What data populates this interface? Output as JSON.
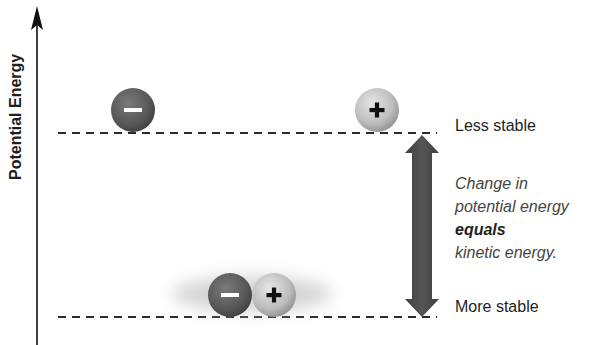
{
  "axis": {
    "label": "Potential Energy"
  },
  "levels": {
    "top": {
      "label": "Less stable"
    },
    "bottom": {
      "label": "More stable"
    }
  },
  "explanation": {
    "line1": "Change in",
    "line2": "potential energy",
    "line3": "equals",
    "line4": "kinetic energy."
  },
  "particles": {
    "negative_symbol": "–",
    "positive_symbol": "+"
  },
  "colors": {
    "negative": "#5e5e5e",
    "positive": "#bdbdbd",
    "arrow": "#4a4a4a",
    "dash": "#2a2a2a"
  }
}
